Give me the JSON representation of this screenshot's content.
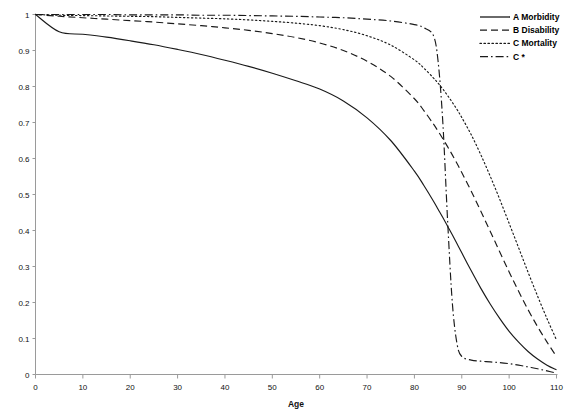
{
  "chart_data": {
    "type": "line",
    "title": "",
    "xlabel": "Age",
    "ylabel": "",
    "xlim": [
      0,
      110
    ],
    "ylim": [
      0,
      1
    ],
    "grid": false,
    "legend_position": "top-right",
    "x_ticks": [
      "0",
      "10",
      "20",
      "30",
      "40",
      "50",
      "60",
      "70",
      "80",
      "90",
      "100",
      "110"
    ],
    "y_ticks": [
      "0",
      "0.1",
      "0.2",
      "0.3",
      "0.4",
      "0.5",
      "0.6",
      "0.7",
      "0.8",
      "0.9",
      "1"
    ],
    "x": [
      0,
      5,
      10,
      15,
      20,
      25,
      30,
      35,
      40,
      45,
      50,
      55,
      60,
      65,
      70,
      75,
      80,
      82,
      84,
      85,
      86,
      87,
      88,
      89,
      90,
      92,
      94,
      96,
      98,
      100,
      102,
      104,
      106,
      108,
      110
    ],
    "series": [
      {
        "name": "A Morbidity",
        "style": "solid",
        "values": [
          1.0,
          0.952,
          0.945,
          0.937,
          0.927,
          0.916,
          0.903,
          0.889,
          0.873,
          0.856,
          0.837,
          0.816,
          0.793,
          0.76,
          0.713,
          0.65,
          0.565,
          0.525,
          0.482,
          0.459,
          0.436,
          0.412,
          0.388,
          0.363,
          0.338,
          0.288,
          0.24,
          0.196,
          0.156,
          0.12,
          0.09,
          0.064,
          0.043,
          0.026,
          0.013
        ]
      },
      {
        "name": "B Disability",
        "style": "dashed",
        "values": [
          1.0,
          0.995,
          0.991,
          0.987,
          0.983,
          0.979,
          0.974,
          0.969,
          0.963,
          0.956,
          0.947,
          0.936,
          0.921,
          0.9,
          0.87,
          0.828,
          0.766,
          0.733,
          0.696,
          0.676,
          0.655,
          0.633,
          0.61,
          0.586,
          0.561,
          0.509,
          0.454,
          0.398,
          0.341,
          0.285,
          0.231,
          0.18,
          0.133,
          0.09,
          0.05
        ]
      },
      {
        "name": "C Mortality",
        "style": "dotted",
        "values": [
          1.0,
          0.998,
          0.997,
          0.996,
          0.995,
          0.994,
          0.992,
          0.99,
          0.988,
          0.985,
          0.981,
          0.976,
          0.969,
          0.958,
          0.941,
          0.915,
          0.874,
          0.851,
          0.824,
          0.809,
          0.793,
          0.775,
          0.756,
          0.736,
          0.714,
          0.666,
          0.611,
          0.551,
          0.487,
          0.42,
          0.352,
          0.284,
          0.218,
          0.155,
          0.096
        ]
      },
      {
        "name": "C *",
        "style": "dashdot",
        "values": [
          1.0,
          1.0,
          1.0,
          1.0,
          0.999,
          0.999,
          0.999,
          0.998,
          0.998,
          0.997,
          0.996,
          0.995,
          0.993,
          0.991,
          0.987,
          0.982,
          0.972,
          0.963,
          0.942,
          0.87,
          0.7,
          0.43,
          0.2,
          0.085,
          0.05,
          0.04,
          0.037,
          0.035,
          0.033,
          0.03,
          0.026,
          0.021,
          0.016,
          0.01,
          0.004
        ]
      }
    ]
  },
  "legend": {
    "items": [
      {
        "label": "A Morbidity",
        "style": "solid"
      },
      {
        "label": "B Disability",
        "style": "dashed"
      },
      {
        "label": "C Mortality",
        "style": "dotted"
      },
      {
        "label": "C *",
        "style": "dashdot"
      }
    ]
  }
}
